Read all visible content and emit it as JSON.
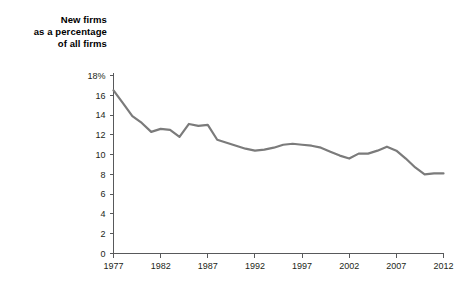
{
  "chart_data": {
    "type": "line",
    "title": "New firms\nas a percentage\nof all firms",
    "title_lines": [
      "New firms",
      "as a percentage",
      "of all firms"
    ],
    "xlabel": "",
    "ylabel": "",
    "xlim": [
      1977,
      2012
    ],
    "ylim": [
      0,
      18
    ],
    "grid": false,
    "legend": "none",
    "series_color": "#7b7b7b",
    "axis_color": "#58595b",
    "x": [
      1977,
      1978,
      1979,
      1980,
      1981,
      1982,
      1983,
      1984,
      1985,
      1986,
      1987,
      1988,
      1989,
      1990,
      1991,
      1992,
      1993,
      1994,
      1995,
      1996,
      1997,
      1998,
      1999,
      2000,
      2001,
      2002,
      2003,
      2004,
      2005,
      2006,
      2007,
      2008,
      2009,
      2010,
      2011,
      2012
    ],
    "values": [
      16.5,
      15.2,
      13.9,
      13.2,
      12.3,
      12.6,
      12.5,
      11.8,
      13.1,
      12.9,
      13.0,
      11.5,
      11.2,
      10.9,
      10.6,
      10.4,
      10.5,
      10.7,
      11.0,
      11.1,
      11.0,
      10.9,
      10.7,
      10.3,
      9.9,
      9.6,
      10.1,
      10.1,
      10.4,
      10.8,
      10.4,
      9.6,
      8.7,
      8.0,
      8.1,
      8.1
    ],
    "y_ticks": [
      0,
      2,
      4,
      6,
      8,
      10,
      12,
      14,
      16,
      18
    ],
    "y_tick_labels": [
      "0",
      "2",
      "4",
      "6",
      "8",
      "10",
      "12",
      "14",
      "16",
      "18%"
    ],
    "x_ticks": [
      1977,
      1982,
      1987,
      1992,
      1997,
      2002,
      2007,
      2012
    ],
    "x_tick_labels": [
      "1977",
      "1982",
      "1987",
      "1992",
      "1997",
      "2002",
      "2007",
      "2012"
    ]
  }
}
